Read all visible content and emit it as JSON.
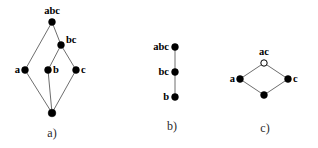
{
  "figure": {
    "background_color": "#ffffff",
    "edge_color": "#6e6e6e",
    "node_fill_color": "#000000",
    "node_open_fill_color": "#ffffff",
    "node_stroke_color": "#000000"
  },
  "panels": [
    {
      "id": "a",
      "caption": "a)",
      "caption_x": 52,
      "caption_y": 133,
      "type": "hasse-diagram",
      "nodes": [
        {
          "id": "a-top",
          "label": "abc",
          "x": 52,
          "y": 22,
          "r": 3.4,
          "filled": true,
          "label_pos": "top",
          "label_dx": 0,
          "label_dy": -6
        },
        {
          "id": "a-bc",
          "label": "bc",
          "x": 61,
          "y": 45,
          "r": 3.4,
          "filled": true,
          "label_pos": "right",
          "label_dx": 5,
          "label_dy": -5
        },
        {
          "id": "a-a",
          "label": "a",
          "x": 25,
          "y": 70,
          "r": 3.4,
          "filled": true,
          "label_pos": "left",
          "label_dx": -5,
          "label_dy": 0
        },
        {
          "id": "a-b",
          "label": "b",
          "x": 48,
          "y": 70,
          "r": 3.4,
          "filled": true,
          "label_pos": "right",
          "label_dx": 5,
          "label_dy": 0
        },
        {
          "id": "a-c",
          "label": "c",
          "x": 76,
          "y": 70,
          "r": 3.4,
          "filled": true,
          "label_pos": "right",
          "label_dx": 5,
          "label_dy": 0
        },
        {
          "id": "a-bottom",
          "label": "",
          "x": 52,
          "y": 113,
          "r": 3.8,
          "filled": true,
          "label_pos": "none",
          "label_dx": 0,
          "label_dy": 0
        }
      ],
      "edges": [
        {
          "from": "a-top",
          "to": "a-a"
        },
        {
          "from": "a-top",
          "to": "a-bc"
        },
        {
          "from": "a-bc",
          "to": "a-b"
        },
        {
          "from": "a-bc",
          "to": "a-c"
        },
        {
          "from": "a-a",
          "to": "a-bottom"
        },
        {
          "from": "a-b",
          "to": "a-bottom"
        },
        {
          "from": "a-c",
          "to": "a-bottom"
        }
      ]
    },
    {
      "id": "b",
      "caption": "b)",
      "caption_x": 172,
      "caption_y": 126,
      "type": "hasse-diagram",
      "nodes": [
        {
          "id": "b-abc",
          "label": "abc",
          "x": 175,
          "y": 47,
          "r": 3.4,
          "filled": true,
          "label_pos": "left",
          "label_dx": -6,
          "label_dy": 0
        },
        {
          "id": "b-bc",
          "label": "bc",
          "x": 175,
          "y": 72,
          "r": 3.4,
          "filled": true,
          "label_pos": "left",
          "label_dx": -6,
          "label_dy": 0
        },
        {
          "id": "b-b",
          "label": "b",
          "x": 175,
          "y": 97,
          "r": 3.4,
          "filled": true,
          "label_pos": "left",
          "label_dx": -6,
          "label_dy": 0
        }
      ],
      "edges": [
        {
          "from": "b-abc",
          "to": "b-bc"
        },
        {
          "from": "b-bc",
          "to": "b-b"
        }
      ]
    },
    {
      "id": "c",
      "caption": "c)",
      "caption_x": 265,
      "caption_y": 128,
      "type": "hasse-diagram",
      "nodes": [
        {
          "id": "c-ac",
          "label": "ac",
          "x": 264,
          "y": 63,
          "r": 3.2,
          "filled": false,
          "label_pos": "top",
          "label_dx": 0,
          "label_dy": -6
        },
        {
          "id": "c-a",
          "label": "a",
          "x": 240,
          "y": 79,
          "r": 3.4,
          "filled": true,
          "label_pos": "left",
          "label_dx": -5,
          "label_dy": 0
        },
        {
          "id": "c-c",
          "label": "c",
          "x": 288,
          "y": 79,
          "r": 3.4,
          "filled": true,
          "label_pos": "right",
          "label_dx": 5,
          "label_dy": 0
        },
        {
          "id": "c-bottom",
          "label": "",
          "x": 264,
          "y": 95,
          "r": 3.4,
          "filled": true,
          "label_pos": "none",
          "label_dx": 0,
          "label_dy": 0
        }
      ],
      "edges": [
        {
          "from": "c-ac",
          "to": "c-a"
        },
        {
          "from": "c-ac",
          "to": "c-c"
        },
        {
          "from": "c-a",
          "to": "c-bottom"
        },
        {
          "from": "c-c",
          "to": "c-bottom"
        }
      ]
    }
  ]
}
